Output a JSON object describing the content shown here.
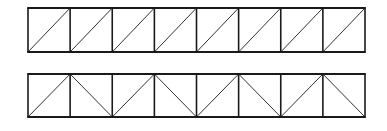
{
  "diagram": {
    "type": "truss-elevations",
    "stroke_color": "#1a1a1a",
    "background": "#ffffff",
    "trusses": [
      {
        "name": "top-truss",
        "panels": 8,
        "x0": 28,
        "x1": 365,
        "y_top": 8,
        "y_bottom": 52,
        "chord_width": 1.8,
        "vertical_width": 1.6,
        "diagonal_width": 0.9,
        "diagonals": [
          "/",
          "/",
          "/",
          "/",
          "/",
          "/",
          "/",
          "/"
        ]
      },
      {
        "name": "bottom-truss",
        "panels": 8,
        "x0": 28,
        "x1": 365,
        "y_top": 74,
        "y_bottom": 117,
        "chord_width": 1.8,
        "vertical_width": 1.6,
        "diagonal_width": 0.9,
        "diagonals": [
          "/",
          "\\",
          "/",
          "\\",
          "/",
          "\\",
          "/",
          "\\"
        ]
      }
    ]
  }
}
